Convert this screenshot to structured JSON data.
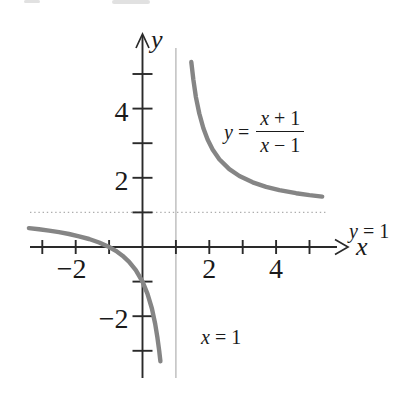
{
  "figure": {
    "axis_labels": {
      "x": "x",
      "y": "y"
    },
    "annotations": {
      "h_asymptote": {
        "var": "y",
        "rest": " = 1"
      },
      "v_asymptote": {
        "var": "x",
        "rest": " = 1"
      },
      "equation": {
        "lhs_var": "y",
        "equals": " = ",
        "num_var": "x",
        "num_rest": " + 1",
        "den_var": "x",
        "den_rest": " − 1"
      }
    },
    "colors": {
      "axis": "#2a2a2a",
      "curve": "#858585",
      "asymptote": "#adadad",
      "text": "#1a1a1a",
      "background": "#ffffff"
    }
  },
  "chart_data": {
    "type": "line",
    "function": "y = (x + 1)/(x − 1)",
    "asymptotes": {
      "vertical": "x = 1",
      "horizontal": "y = 1"
    },
    "intercepts": {
      "x_intercept": [
        -1,
        0
      ],
      "y_intercept": [
        0,
        -1
      ]
    },
    "xlim": [
      -3.4,
      5.9
    ],
    "ylim": [
      -3.9,
      6.2
    ],
    "grid": false,
    "legend": false,
    "x_ticks": [
      -3,
      -2,
      -1,
      1,
      2,
      3,
      4,
      5
    ],
    "y_ticks": [
      -3,
      -2,
      -1,
      1,
      2,
      3,
      4,
      5
    ],
    "x_tick_labels": [
      {
        "value": -2,
        "label": "−2"
      },
      {
        "value": 2,
        "label": "2"
      },
      {
        "value": 4,
        "label": "4"
      }
    ],
    "y_tick_labels": [
      {
        "value": -2,
        "label": "−2"
      },
      {
        "value": 2,
        "label": "2"
      },
      {
        "value": 4,
        "label": "4"
      }
    ],
    "series": [
      {
        "name": "left branch",
        "points": [
          [
            -3.4,
            0.545
          ],
          [
            -3.1,
            0.512
          ],
          [
            -2.8,
            0.474
          ],
          [
            -2.5,
            0.429
          ],
          [
            -2.2,
            0.375
          ],
          [
            -1.9,
            0.31
          ],
          [
            -1.6,
            0.231
          ],
          [
            -1.3,
            0.13
          ],
          [
            -1.0,
            0.0
          ],
          [
            -0.8,
            -0.111
          ],
          [
            -0.6,
            -0.25
          ],
          [
            -0.4,
            -0.429
          ],
          [
            -0.2,
            -0.667
          ],
          [
            0.0,
            -1.0
          ],
          [
            0.15,
            -1.353
          ],
          [
            0.28,
            -1.778
          ],
          [
            0.38,
            -2.226
          ],
          [
            0.45,
            -2.636
          ],
          [
            0.5,
            -3.0
          ],
          [
            0.535,
            -3.301
          ]
        ]
      },
      {
        "name": "right branch",
        "points": [
          [
            1.46,
            5.348
          ],
          [
            1.52,
            4.846
          ],
          [
            1.6,
            4.333
          ],
          [
            1.7,
            3.857
          ],
          [
            1.82,
            3.439
          ],
          [
            1.95,
            3.105
          ],
          [
            2.1,
            2.818
          ],
          [
            2.3,
            2.538
          ],
          [
            2.6,
            2.25
          ],
          [
            2.9,
            2.053
          ],
          [
            3.3,
            1.87
          ],
          [
            3.7,
            1.741
          ],
          [
            4.1,
            1.645
          ],
          [
            4.6,
            1.556
          ],
          [
            5.0,
            1.5
          ],
          [
            5.38,
            1.457
          ]
        ]
      }
    ]
  }
}
